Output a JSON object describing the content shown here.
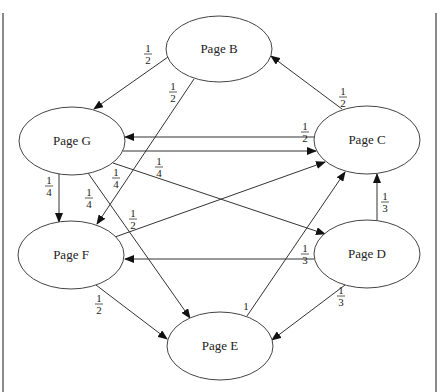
{
  "diagram": {
    "title": "",
    "nodes": [
      {
        "id": "B",
        "label": "Page B",
        "cx": 219,
        "cy": 49,
        "rx": 53,
        "ry": 33
      },
      {
        "id": "G",
        "label": "Page G",
        "cx": 72,
        "cy": 141,
        "rx": 53,
        "ry": 34
      },
      {
        "id": "C",
        "label": "Page C",
        "cx": 367,
        "cy": 140,
        "rx": 53,
        "ry": 34
      },
      {
        "id": "F",
        "label": "Page F",
        "cx": 71,
        "cy": 255,
        "rx": 53,
        "ry": 34
      },
      {
        "id": "D",
        "label": "Page D",
        "cx": 367,
        "cy": 254,
        "rx": 53,
        "ry": 34
      },
      {
        "id": "E",
        "label": "Page E",
        "cx": 220,
        "cy": 346,
        "rx": 53,
        "ry": 34
      }
    ],
    "edges": [
      {
        "from": "B",
        "to": "G",
        "weight": "1/2",
        "x1": 168,
        "y1": 57,
        "x2": 94,
        "y2": 109,
        "lx": 148,
        "ly": 52
      },
      {
        "from": "B",
        "to": "F",
        "weight": "1/2",
        "x1": 194,
        "y1": 79,
        "x2": 97,
        "y2": 224,
        "lx": 173,
        "ly": 90
      },
      {
        "from": "C",
        "to": "B",
        "weight": "1/2",
        "x1": 342,
        "y1": 109,
        "x2": 271,
        "y2": 56,
        "lx": 343,
        "ly": 95
      },
      {
        "from": "C",
        "to": "G",
        "weight": "1/2",
        "x1": 315,
        "y1": 137,
        "x2": 125,
        "y2": 137,
        "lx": 305,
        "ly": 130
      },
      {
        "from": "G",
        "to": "C",
        "weight": "1/4",
        "x1": 123,
        "y1": 151,
        "x2": 316,
        "y2": 151,
        "lx": 159,
        "ly": 165
      },
      {
        "from": "G",
        "to": "D",
        "weight": "1/4",
        "x1": 113,
        "y1": 163,
        "x2": 325,
        "y2": 234,
        "lx": 116,
        "ly": 176
      },
      {
        "from": "G",
        "to": "F",
        "weight": "1/4",
        "x1": 59,
        "y1": 174,
        "x2": 59,
        "y2": 222,
        "lx": 49,
        "ly": 184
      },
      {
        "from": "G",
        "to": "E",
        "weight": "1/4",
        "x1": 88,
        "y1": 173,
        "x2": 190,
        "y2": 318,
        "lx": 89,
        "ly": 196
      },
      {
        "from": "F",
        "to": "C",
        "weight": "1/2",
        "x1": 115,
        "y1": 237,
        "x2": 325,
        "y2": 162,
        "lx": 133,
        "ly": 217
      },
      {
        "from": "F",
        "to": "E",
        "weight": "1/2",
        "x1": 96,
        "y1": 285,
        "x2": 167,
        "y2": 339,
        "lx": 99,
        "ly": 302
      },
      {
        "from": "D",
        "to": "F",
        "weight": "1/3",
        "x1": 314,
        "y1": 259,
        "x2": 125,
        "y2": 259,
        "lx": 305,
        "ly": 252
      },
      {
        "from": "D",
        "to": "C",
        "weight": "1/3",
        "x1": 377,
        "y1": 221,
        "x2": 377,
        "y2": 174,
        "lx": 385,
        "ly": 200
      },
      {
        "from": "D",
        "to": "E",
        "weight": "1/3",
        "x1": 345,
        "y1": 285,
        "x2": 272,
        "y2": 340,
        "lx": 341,
        "ly": 294
      },
      {
        "from": "E",
        "to": "C",
        "weight": "1",
        "x1": 247,
        "y1": 316,
        "x2": 345,
        "y2": 172,
        "lx": 246,
        "ly": 304
      }
    ]
  },
  "chart_data": {
    "type": "graph",
    "title": "",
    "nodes": [
      "Page B",
      "Page C",
      "Page D",
      "Page E",
      "Page F",
      "Page G"
    ],
    "edges": [
      {
        "from": "Page B",
        "to": "Page G",
        "weight": "1/2"
      },
      {
        "from": "Page B",
        "to": "Page F",
        "weight": "1/2"
      },
      {
        "from": "Page C",
        "to": "Page B",
        "weight": "1/2"
      },
      {
        "from": "Page C",
        "to": "Page G",
        "weight": "1/2"
      },
      {
        "from": "Page G",
        "to": "Page C",
        "weight": "1/4"
      },
      {
        "from": "Page G",
        "to": "Page D",
        "weight": "1/4"
      },
      {
        "from": "Page G",
        "to": "Page F",
        "weight": "1/4"
      },
      {
        "from": "Page G",
        "to": "Page E",
        "weight": "1/4"
      },
      {
        "from": "Page F",
        "to": "Page C",
        "weight": "1/2"
      },
      {
        "from": "Page F",
        "to": "Page E",
        "weight": "1/2"
      },
      {
        "from": "Page D",
        "to": "Page F",
        "weight": "1/3"
      },
      {
        "from": "Page D",
        "to": "Page C",
        "weight": "1/3"
      },
      {
        "from": "Page D",
        "to": "Page E",
        "weight": "1/3"
      },
      {
        "from": "Page E",
        "to": "Page C",
        "weight": "1"
      }
    ]
  }
}
